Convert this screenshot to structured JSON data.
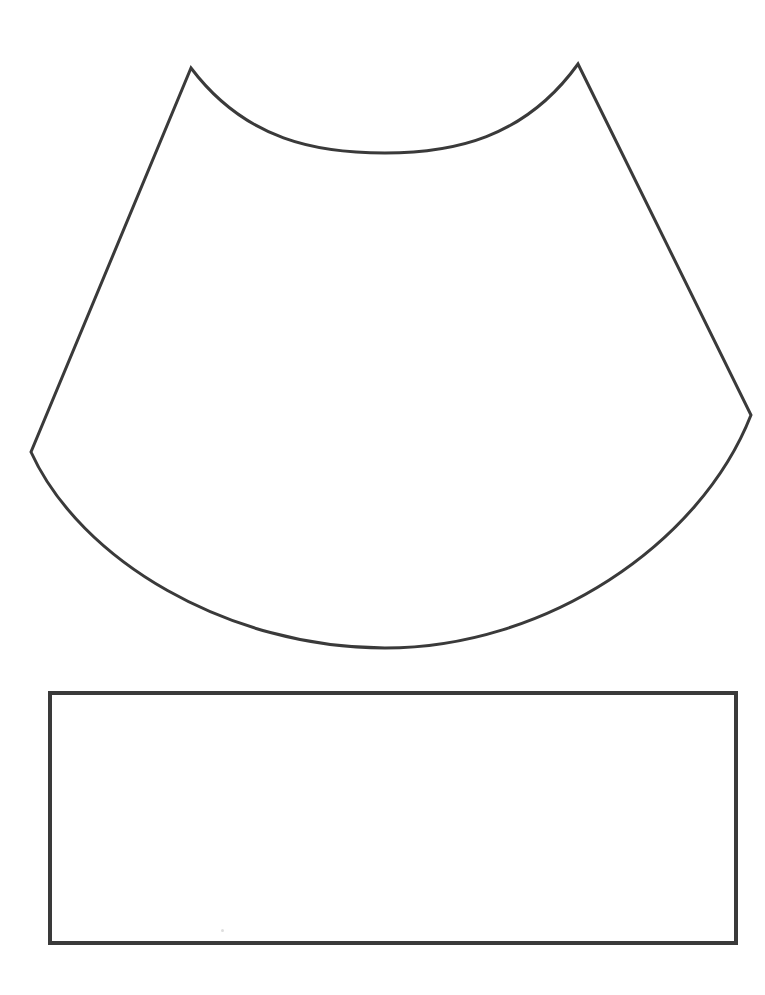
{
  "document": {
    "title": "Pattern Template Sheet",
    "background_color": "#ffffff",
    "width": 765,
    "height": 995,
    "description": "Black line-art cut-out pattern template: a curved cone/sector panel above an empty rectangle strip"
  },
  "style": {
    "stroke_color": "#3a3a3a",
    "stroke_color_light": "#4a4a4a",
    "stroke_width": 3,
    "rect_stroke_width": 4,
    "fill": "none"
  },
  "shapes": [
    {
      "name": "cone-panel",
      "label": "Curved cone sector panel",
      "type": "closed-path",
      "stroke": "#3a3a3a",
      "stroke_width": 3,
      "fill": "none",
      "vertices": [
        {
          "name": "top-left-peak",
          "x": 191,
          "y": 68
        },
        {
          "name": "top-right-peak",
          "x": 578,
          "y": 64
        },
        {
          "name": "right-corner",
          "x": 751,
          "y": 415
        },
        {
          "name": "left-corner",
          "x": 31,
          "y": 452
        }
      ],
      "edges": [
        {
          "name": "top-arc",
          "kind": "curve",
          "from": "top-left-peak",
          "to": "top-right-peak",
          "curvature": "concave-down",
          "lowest_point": {
            "x": 385,
            "y": 153
          }
        },
        {
          "name": "right-edge",
          "kind": "line",
          "from": "top-right-peak",
          "to": "right-corner"
        },
        {
          "name": "bottom-arc",
          "kind": "curve",
          "from": "right-corner",
          "to": "left-corner",
          "curvature": "convex-down",
          "lowest_point": {
            "x": 385,
            "y": 648
          }
        },
        {
          "name": "left-edge",
          "kind": "line",
          "from": "left-corner",
          "to": "top-left-peak"
        }
      ],
      "path_d": "M 191 68 C 246 141, 318 153, 385 153 C 452 153, 524 139, 578 64 L 751 415 C 700 545, 545 648, 385 648 C 228 648, 80 560, 31 452 Z"
    },
    {
      "name": "rectangle-strip",
      "label": "Empty rectangular strip",
      "type": "rectangle",
      "stroke": "#3a3a3a",
      "stroke_width": 4,
      "fill": "none",
      "x": 50,
      "y": 693,
      "width": 686,
      "height": 250,
      "corners": {
        "top_left": {
          "x": 50,
          "y": 693
        },
        "top_right": {
          "x": 736,
          "y": 693
        },
        "bottom_right": {
          "x": 736,
          "y": 943
        },
        "bottom_left": {
          "x": 50,
          "y": 942
        }
      }
    }
  ],
  "artifacts": [
    {
      "name": "scan-speck",
      "x": 221,
      "y": 929,
      "color": "#d8d8d8"
    }
  ]
}
